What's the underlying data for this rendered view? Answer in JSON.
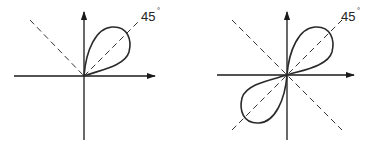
{
  "diagrams": [
    {
      "id": "single-lobe",
      "angle_label": "45",
      "degree_symbol": "°",
      "description": "Single teardrop lobe oriented along 45° line in first quadrant; dashed line through origin at 135°/−45° (upper-left) and 45°"
    },
    {
      "id": "double-lobe",
      "angle_label": "45",
      "degree_symbol": "°",
      "description": "Two opposing teardrop lobes along the 45° line (first and third quadrants); dashed lines at 45° and 135° crossing at origin"
    }
  ],
  "colors": {
    "stroke": "#1a1a1a",
    "background": "#ffffff"
  }
}
